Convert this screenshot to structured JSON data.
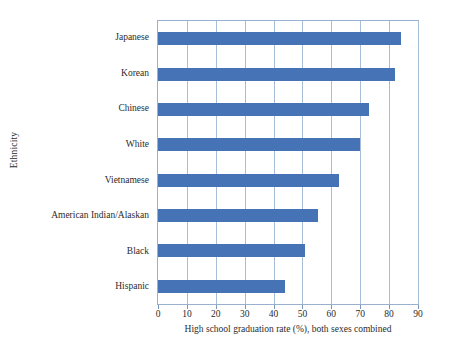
{
  "chart_data": {
    "type": "bar",
    "orientation": "horizontal",
    "title": "",
    "xlabel": "High school graduation rate (%), both sexes combined",
    "ylabel": "Ethnicity",
    "categories": [
      "Japanese",
      "Korean",
      "Chinese",
      "White",
      "Vietnamese",
      "American Indian/Alaskan",
      "Black",
      "Hispanic"
    ],
    "values": [
      84,
      82,
      73,
      70,
      62.5,
      55.5,
      51,
      44
    ],
    "xlim": [
      0,
      90
    ],
    "xticks": [
      0,
      10,
      20,
      30,
      40,
      50,
      60,
      70,
      80,
      90
    ],
    "xtick_labels": [
      "0",
      "10",
      "20",
      "30",
      "40",
      "50",
      "60",
      "70",
      "80",
      "90"
    ],
    "grid": "vertical",
    "legend": "none",
    "bar_color": "#4573b5",
    "gridline_color": "#a8bdd8",
    "plot_border_color": "#9ab0cf"
  }
}
